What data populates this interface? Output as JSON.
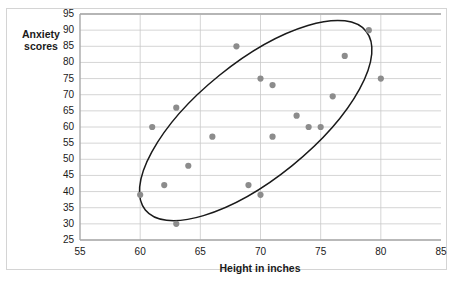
{
  "chart_data": {
    "type": "scatter",
    "title": "",
    "xlabel": "Height in inches",
    "ylabel": "Anxiety scores",
    "xlim": [
      55,
      85
    ],
    "ylim": [
      25,
      95
    ],
    "xticks": [
      55,
      60,
      65,
      70,
      75,
      80,
      85
    ],
    "yticks": [
      25,
      30,
      35,
      40,
      45,
      50,
      55,
      60,
      65,
      70,
      75,
      80,
      85,
      90,
      95
    ],
    "grid": "horizontal-and-vertical",
    "legend": "none",
    "marker_color": "#8c8c8c",
    "annotation": {
      "shape": "ellipse",
      "description": "hand-drawn ellipse enclosing the scatter cloud, oriented along the positive correlation direction",
      "color": "#1a1a1a"
    },
    "points": [
      {
        "x": 60,
        "y": 39
      },
      {
        "x": 61,
        "y": 60
      },
      {
        "x": 62,
        "y": 42
      },
      {
        "x": 63,
        "y": 30
      },
      {
        "x": 63,
        "y": 66
      },
      {
        "x": 64,
        "y": 48
      },
      {
        "x": 66,
        "y": 57
      },
      {
        "x": 68,
        "y": 85
      },
      {
        "x": 69,
        "y": 42
      },
      {
        "x": 70,
        "y": 39
      },
      {
        "x": 70,
        "y": 75
      },
      {
        "x": 71,
        "y": 57
      },
      {
        "x": 71,
        "y": 73
      },
      {
        "x": 73,
        "y": 63.5
      },
      {
        "x": 74,
        "y": 60
      },
      {
        "x": 75,
        "y": 60
      },
      {
        "x": 76,
        "y": 69.5
      },
      {
        "x": 77,
        "y": 82
      },
      {
        "x": 79,
        "y": 90
      },
      {
        "x": 80,
        "y": 75
      }
    ]
  },
  "axes": {
    "y_title_line1": "Anxiety",
    "y_title_line2": "scores",
    "x_title": "Height in inches",
    "y_tick_labels": [
      "95",
      "90",
      "85",
      "80",
      "75",
      "70",
      "65",
      "60",
      "55",
      "50",
      "45",
      "40",
      "35",
      "30",
      "25"
    ],
    "x_tick_labels": [
      "55",
      "60",
      "65",
      "70",
      "75",
      "80",
      "85"
    ]
  }
}
